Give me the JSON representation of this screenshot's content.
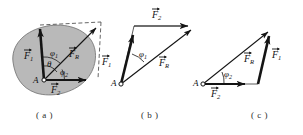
{
  "figure": {
    "type": "physics-vector-diagram",
    "colors": {
      "body_fill": "#b9b9b9",
      "body_stroke": "#6b6b6b",
      "vector_stroke": "#1a1a1a",
      "dashed_stroke": "#4a4a4a",
      "background": "#ffffff",
      "text": "#111111"
    }
  },
  "panels": [
    {
      "id": "a",
      "caption": "( a )",
      "point_label": "A",
      "vectors": [
        {
          "name": "F1",
          "base": "F",
          "sub": "1"
        },
        {
          "name": "F2",
          "base": "F",
          "sub": "2"
        },
        {
          "name": "FR",
          "base": "F",
          "sub": "R"
        }
      ],
      "angles": [
        {
          "name": "phi1",
          "glyph": "φ",
          "sub": "1"
        },
        {
          "name": "theta",
          "glyph": "θ",
          "sub": ""
        },
        {
          "name": "phi2",
          "glyph": "φ",
          "sub": "2"
        }
      ]
    },
    {
      "id": "b",
      "caption": "( b )",
      "point_label": "A",
      "vectors": [
        {
          "name": "F1",
          "base": "F",
          "sub": "1"
        },
        {
          "name": "F2",
          "base": "F",
          "sub": "2"
        },
        {
          "name": "FR",
          "base": "F",
          "sub": "R"
        }
      ],
      "angles": [
        {
          "name": "phi1",
          "glyph": "φ",
          "sub": "1"
        }
      ]
    },
    {
      "id": "c",
      "caption": "( c )",
      "point_label": "A",
      "vectors": [
        {
          "name": "F1",
          "base": "F",
          "sub": "1"
        },
        {
          "name": "F2",
          "base": "F",
          "sub": "2"
        },
        {
          "name": "FR",
          "base": "F",
          "sub": "R"
        }
      ],
      "angles": [
        {
          "name": "phi2",
          "glyph": "φ",
          "sub": "2"
        }
      ]
    }
  ],
  "labels": {
    "a": {
      "F1": {
        "base": "F",
        "sub": "1"
      },
      "F2": {
        "base": "F",
        "sub": "2"
      },
      "FR": {
        "base": "F",
        "sub": "R"
      },
      "phi1": {
        "glyph": "φ",
        "sub": "1"
      },
      "theta": {
        "glyph": "θ",
        "sub": ""
      },
      "phi2": {
        "glyph": "φ",
        "sub": "2"
      },
      "point": "A",
      "caption": "( a )"
    },
    "b": {
      "F1": {
        "base": "F",
        "sub": "1"
      },
      "F2": {
        "base": "F",
        "sub": "2"
      },
      "FR": {
        "base": "F",
        "sub": "R"
      },
      "phi1": {
        "glyph": "φ",
        "sub": "1"
      },
      "point": "A",
      "caption": "( b )"
    },
    "c": {
      "F1": {
        "base": "F",
        "sub": "1"
      },
      "F2": {
        "base": "F",
        "sub": "2"
      },
      "FR": {
        "base": "F",
        "sub": "R"
      },
      "phi2": {
        "glyph": "φ",
        "sub": "2"
      },
      "point": "A",
      "caption": "( c )"
    }
  }
}
